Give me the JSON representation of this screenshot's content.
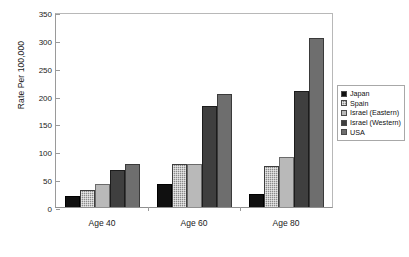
{
  "chart_data": {
    "type": "bar",
    "title": "",
    "subtitle": "",
    "xlabel": "",
    "ylabel": "Rate Per 100,000",
    "categories": [
      "Age 40",
      "Age 60",
      "Age 80"
    ],
    "ylim": [
      0,
      350
    ],
    "yticks": [
      0,
      50,
      100,
      150,
      200,
      250,
      300,
      350
    ],
    "ytick_labels": [
      "0",
      "50",
      "100",
      "150",
      "200",
      "250",
      "300",
      "350"
    ],
    "grid": false,
    "legend_position": "right",
    "series": [
      {
        "name": "Japan",
        "color": "#101010",
        "values": [
          20,
          42,
          23
        ]
      },
      {
        "name": "Spain",
        "color": "#8a8a8a",
        "values": [
          31,
          77,
          74
        ]
      },
      {
        "name": "Israel (Eastern)",
        "color": "#b9b9b9",
        "values": [
          42,
          77,
          89
        ]
      },
      {
        "name": "Israel (Western)",
        "color": "#3f3f3f",
        "values": [
          66,
          182,
          208
        ]
      },
      {
        "name": "USA",
        "color": "#6e6e6e",
        "values": [
          77,
          202,
          303
        ]
      }
    ]
  }
}
